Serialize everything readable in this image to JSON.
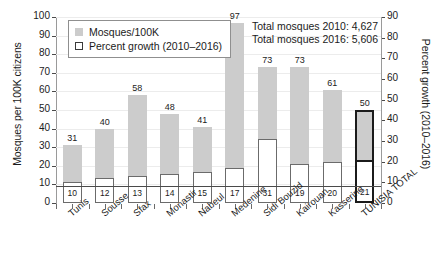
{
  "chart_data": {
    "type": "bar",
    "title": "",
    "subtitle": "",
    "xlabel": "",
    "ylabel": "Mosques per 100K citizens",
    "y2label": "Percent growth (2010–2016)",
    "ylim": [
      0,
      100
    ],
    "y2lim": [
      0,
      90
    ],
    "yticks": [
      "0",
      "10",
      "20",
      "30",
      "40",
      "50",
      "60",
      "70",
      "80",
      "90",
      "100"
    ],
    "y2ticks": [
      "0",
      "10",
      "20",
      "30",
      "40",
      "50",
      "60",
      "70",
      "80",
      "90"
    ],
    "grid": true,
    "legend_position": "top-left",
    "categories": [
      "Tunis",
      "Sousse",
      "Sfax",
      "Monastir",
      "Nabeul",
      "Medenine",
      "Sidi Bouzid",
      "Kairouan",
      "Kasserine",
      "TUNISIA TOTAL"
    ],
    "series": [
      {
        "name": "Mosques/100K",
        "axis": "left",
        "color": "#cccccc",
        "values": [
          31,
          40,
          58,
          48,
          41,
          97,
          73,
          73,
          61,
          50
        ]
      },
      {
        "name": "Percent growth (2010–2016)",
        "axis": "right",
        "color": "#ffffff",
        "values": [
          10,
          12,
          13,
          14,
          15,
          17,
          31,
          19,
          20,
          21
        ]
      }
    ],
    "annotations": [
      "Total mosques 2010: 4,627",
      "Total mosques 2016: 5,606"
    ],
    "highlighted_category": "TUNISIA TOTAL"
  },
  "legend": {
    "items": [
      {
        "label": "Mosques/100K",
        "swatch": "filled"
      },
      {
        "label": "Percent growth (2010–2016)",
        "swatch": "hollow"
      }
    ]
  },
  "annotation": {
    "line1": "Total mosques 2010: 4,627",
    "line2": "Total mosques 2016: 5,606"
  },
  "axes": {
    "left_title": "Mosques per 100K citizens",
    "right_title": "Percent growth (2010–2016)"
  },
  "colors": {
    "bar_fill": "#cccccc",
    "bar_outline": "#6b6b6b",
    "highlight_outline": "#1b1b1b",
    "grid": "#ececec",
    "axis": "#4a4a4a",
    "text": "#1b1b1b"
  }
}
